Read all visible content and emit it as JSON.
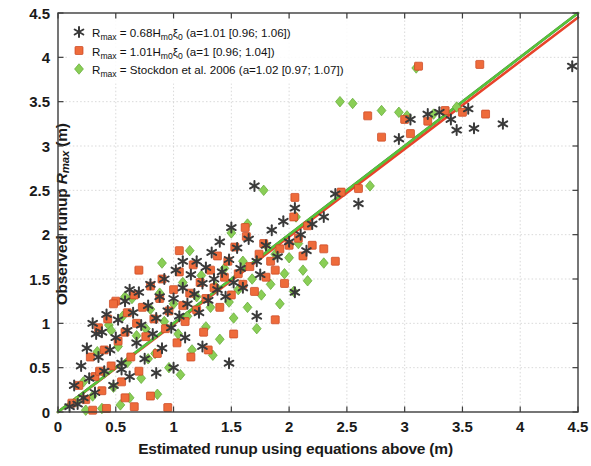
{
  "chart_data": {
    "type": "scatter",
    "title": "",
    "xlabel": "Estimated runup using equations above (m)",
    "ylabel_prefix": "Observed runup ",
    "ylabel_symbol": "R",
    "ylabel_symbol_sub": "max",
    "ylabel_suffix": " (m)",
    "xlim": [
      0,
      4.5
    ],
    "ylim": [
      0,
      4.5
    ],
    "xticks": [
      "0",
      "0.5",
      "1",
      "1.5",
      "2",
      "2.5",
      "3",
      "3.5",
      "4",
      "4.5"
    ],
    "yticks": [
      "0",
      "0.5",
      "1",
      "1.5",
      "2",
      "2.5",
      "3",
      "3.5",
      "4",
      "4.5"
    ],
    "xtick_values": [
      0,
      0.5,
      1,
      1.5,
      2,
      2.5,
      3,
      3.5,
      4,
      4.5
    ],
    "ytick_values": [
      0,
      0.5,
      1,
      1.5,
      2,
      2.5,
      3,
      3.5,
      4,
      4.5
    ],
    "grid": true,
    "grid_color": "#c8c8c8",
    "legend_position": "upper-left",
    "series": [
      {
        "name": "series-asterisk",
        "marker": "asterisk",
        "color": "#3a3a3a",
        "legend_prefix": "R",
        "legend_sub": "max",
        "legend_eq": " = 0.68H",
        "legend_eq_sub": "m0",
        "legend_xi": "ξ",
        "legend_xi_sub": "0",
        "legend_stats": " (a=1.01 [0.96; 1.06])",
        "fit_a": 1.01,
        "fit_ci": [
          0.96,
          1.06
        ],
        "points": [
          [
            0.1,
            0.06
          ],
          [
            0.14,
            0.3
          ],
          [
            0.17,
            0.09
          ],
          [
            0.2,
            0.52
          ],
          [
            0.22,
            0.16
          ],
          [
            0.25,
            0.72
          ],
          [
            0.27,
            0.38
          ],
          [
            0.3,
            1.0
          ],
          [
            0.32,
            0.22
          ],
          [
            0.35,
            0.62
          ],
          [
            0.38,
            0.9
          ],
          [
            0.4,
            0.46
          ],
          [
            0.42,
            1.1
          ],
          [
            0.45,
            0.7
          ],
          [
            0.48,
            0.3
          ],
          [
            0.5,
            0.84
          ],
          [
            0.52,
            1.04
          ],
          [
            0.55,
            0.55
          ],
          [
            0.58,
            1.25
          ],
          [
            0.6,
            0.92
          ],
          [
            0.62,
            0.4
          ],
          [
            0.65,
            1.12
          ],
          [
            0.68,
            0.78
          ],
          [
            0.7,
            1.35
          ],
          [
            0.72,
            0.98
          ],
          [
            0.75,
            0.6
          ],
          [
            0.78,
            1.2
          ],
          [
            0.8,
            1.44
          ],
          [
            0.82,
            0.88
          ],
          [
            0.85,
            1.06
          ],
          [
            0.88,
            1.3
          ],
          [
            0.9,
            0.72
          ],
          [
            0.92,
            1.5
          ],
          [
            0.95,
            1.14
          ],
          [
            0.98,
            0.95
          ],
          [
            1.0,
            1.28
          ],
          [
            1.02,
            1.6
          ],
          [
            1.05,
            1.08
          ],
          [
            1.08,
            1.4
          ],
          [
            1.1,
            0.84
          ],
          [
            1.12,
            1.22
          ],
          [
            1.15,
            1.55
          ],
          [
            1.18,
            1.33
          ],
          [
            1.2,
            1.7
          ],
          [
            1.22,
            1.12
          ],
          [
            1.25,
            1.45
          ],
          [
            1.28,
            1.63
          ],
          [
            1.3,
            1.26
          ],
          [
            1.33,
            1.8
          ],
          [
            1.35,
            1.5
          ],
          [
            1.38,
            1.38
          ],
          [
            1.4,
            1.92
          ],
          [
            1.42,
            1.58
          ],
          [
            1.45,
            1.3
          ],
          [
            1.48,
            1.72
          ],
          [
            1.5,
            2.08
          ],
          [
            1.52,
            1.46
          ],
          [
            1.55,
            1.85
          ],
          [
            1.58,
            1.62
          ],
          [
            1.6,
            1.4
          ],
          [
            1.65,
            1.95
          ],
          [
            1.7,
            2.55
          ],
          [
            1.72,
            1.7
          ],
          [
            1.75,
            1.55
          ],
          [
            1.8,
            1.88
          ],
          [
            1.85,
            2.05
          ],
          [
            1.9,
            1.75
          ],
          [
            1.95,
            2.15
          ],
          [
            2.0,
            1.92
          ],
          [
            2.05,
            2.3
          ],
          [
            2.1,
            2.0
          ],
          [
            2.15,
            1.82
          ],
          [
            2.2,
            2.12
          ],
          [
            2.3,
            2.2
          ],
          [
            2.4,
            2.46
          ],
          [
            2.6,
            2.35
          ],
          [
            2.95,
            3.08
          ],
          [
            3.05,
            3.3
          ],
          [
            3.2,
            3.36
          ],
          [
            3.3,
            3.38
          ],
          [
            3.4,
            3.3
          ],
          [
            3.45,
            3.18
          ],
          [
            3.55,
            3.42
          ],
          [
            3.6,
            3.2
          ],
          [
            3.85,
            3.25
          ],
          [
            4.45,
            3.9
          ],
          [
            0.55,
            0.48
          ],
          [
            1.48,
            0.55
          ],
          [
            1.72,
            1.08
          ],
          [
            0.85,
            0.44
          ],
          [
            0.33,
            0.88
          ],
          [
            1.0,
            0.5
          ],
          [
            1.25,
            0.74
          ],
          [
            2.05,
            1.35
          ],
          [
            0.62,
            1.38
          ],
          [
            1.08,
            1.7
          ]
        ]
      },
      {
        "name": "series-square",
        "marker": "square",
        "color": "#ee6b3b",
        "legend_prefix": "R",
        "legend_sub": "max",
        "legend_eq": " = 1.01H",
        "legend_eq_sub": "m0",
        "legend_xi": "ξ",
        "legend_xi_sub": "0",
        "legend_stats": " (a=1 [0.96; 1.04])",
        "fit_a": 1.0,
        "fit_ci": [
          0.96,
          1.04
        ],
        "points": [
          [
            0.12,
            0.1
          ],
          [
            0.18,
            0.3
          ],
          [
            0.24,
            0.14
          ],
          [
            0.28,
            0.62
          ],
          [
            0.32,
            0.4
          ],
          [
            0.35,
            0.95
          ],
          [
            0.38,
            0.24
          ],
          [
            0.4,
            0.7
          ],
          [
            0.43,
            1.05
          ],
          [
            0.46,
            0.52
          ],
          [
            0.5,
            1.25
          ],
          [
            0.52,
            0.8
          ],
          [
            0.55,
            0.34
          ],
          [
            0.58,
            0.9
          ],
          [
            0.6,
            1.12
          ],
          [
            0.63,
            0.62
          ],
          [
            0.66,
            1.32
          ],
          [
            0.68,
            1.0
          ],
          [
            0.7,
            0.46
          ],
          [
            0.73,
            1.18
          ],
          [
            0.76,
            0.85
          ],
          [
            0.8,
            1.42
          ],
          [
            0.83,
            1.05
          ],
          [
            0.86,
            0.66
          ],
          [
            0.88,
            1.28
          ],
          [
            0.9,
            1.5
          ],
          [
            0.93,
            0.94
          ],
          [
            0.96,
            1.14
          ],
          [
            1.0,
            1.38
          ],
          [
            1.03,
            0.78
          ],
          [
            1.05,
            1.58
          ],
          [
            1.08,
            1.2
          ],
          [
            1.1,
            1.02
          ],
          [
            1.14,
            1.34
          ],
          [
            1.17,
            1.66
          ],
          [
            1.2,
            1.15
          ],
          [
            1.23,
            1.46
          ],
          [
            1.26,
            0.9
          ],
          [
            1.28,
            1.28
          ],
          [
            1.32,
            1.6
          ],
          [
            1.35,
            1.4
          ],
          [
            1.38,
            1.76
          ],
          [
            1.4,
            1.18
          ],
          [
            1.44,
            1.52
          ],
          [
            1.47,
            1.7
          ],
          [
            1.5,
            1.32
          ],
          [
            1.53,
            1.86
          ],
          [
            1.56,
            1.56
          ],
          [
            1.6,
            1.44
          ],
          [
            1.63,
            1.98
          ],
          [
            1.66,
            1.64
          ],
          [
            1.7,
            1.36
          ],
          [
            1.74,
            1.78
          ],
          [
            1.78,
            1.9
          ],
          [
            1.8,
            1.52
          ],
          [
            1.84,
            1.7
          ],
          [
            1.88,
            1.6
          ],
          [
            1.92,
            1.84
          ],
          [
            1.96,
            1.45
          ],
          [
            2.0,
            1.88
          ],
          [
            2.04,
            2.2
          ],
          [
            2.08,
            1.96
          ],
          [
            2.12,
            1.76
          ],
          [
            2.16,
            2.1
          ],
          [
            2.2,
            1.88
          ],
          [
            2.3,
            1.84
          ],
          [
            2.45,
            2.48
          ],
          [
            2.6,
            2.52
          ],
          [
            2.8,
            3.1
          ],
          [
            3.0,
            3.3
          ],
          [
            3.05,
            3.14
          ],
          [
            3.12,
            3.9
          ],
          [
            3.2,
            3.28
          ],
          [
            3.35,
            3.4
          ],
          [
            3.5,
            3.38
          ],
          [
            3.65,
            3.92
          ],
          [
            3.7,
            3.36
          ],
          [
            0.3,
            0.02
          ],
          [
            0.42,
            0.04
          ],
          [
            0.66,
            0.06
          ],
          [
            0.95,
            0.05
          ],
          [
            0.58,
            0.16
          ],
          [
            0.8,
            0.18
          ],
          [
            1.15,
            0.62
          ],
          [
            1.3,
            0.7
          ],
          [
            1.52,
            0.88
          ],
          [
            1.88,
            1.04
          ],
          [
            2.4,
            1.7
          ],
          [
            2.68,
            3.34
          ],
          [
            0.7,
            1.6
          ],
          [
            1.05,
            1.82
          ],
          [
            0.48,
            1.22
          ],
          [
            0.36,
            0.46
          ],
          [
            2.05,
            2.42
          ],
          [
            1.62,
            2.08
          ]
        ]
      },
      {
        "name": "series-diamond",
        "marker": "diamond",
        "color": "#8ace56",
        "legend_prefix": "R",
        "legend_sub": "max",
        "legend_eq": " = Stockdon et al. 2006",
        "legend_eq_sub": "",
        "legend_xi": "",
        "legend_xi_sub": "",
        "legend_stats": " (a=1.02 [0.97; 1.07])",
        "fit_a": 1.02,
        "fit_ci": [
          0.97,
          1.07
        ],
        "points": [
          [
            0.16,
            0.12
          ],
          [
            0.22,
            0.34
          ],
          [
            0.3,
            0.18
          ],
          [
            0.34,
            0.68
          ],
          [
            0.4,
            0.44
          ],
          [
            0.44,
            0.98
          ],
          [
            0.48,
            0.28
          ],
          [
            0.52,
            0.74
          ],
          [
            0.56,
            1.08
          ],
          [
            0.6,
            0.56
          ],
          [
            0.64,
            1.28
          ],
          [
            0.68,
            0.86
          ],
          [
            0.72,
            0.38
          ],
          [
            0.76,
            0.94
          ],
          [
            0.8,
            1.16
          ],
          [
            0.84,
            0.66
          ],
          [
            0.88,
            1.34
          ],
          [
            0.92,
            1.02
          ],
          [
            0.96,
            0.5
          ],
          [
            1.0,
            1.22
          ],
          [
            1.04,
            0.88
          ],
          [
            1.08,
            1.46
          ],
          [
            1.12,
            1.08
          ],
          [
            1.16,
            0.7
          ],
          [
            1.2,
            1.3
          ],
          [
            1.24,
            1.54
          ],
          [
            1.28,
            0.96
          ],
          [
            1.32,
            1.18
          ],
          [
            1.36,
            1.42
          ],
          [
            1.4,
            0.82
          ],
          [
            1.44,
            1.62
          ],
          [
            1.48,
            1.24
          ],
          [
            1.52,
            1.06
          ],
          [
            1.56,
            1.38
          ],
          [
            1.6,
            1.7
          ],
          [
            1.64,
            1.18
          ],
          [
            1.68,
            1.5
          ],
          [
            1.72,
            0.94
          ],
          [
            1.76,
            1.32
          ],
          [
            1.8,
            1.88
          ],
          [
            1.84,
            1.44
          ],
          [
            1.88,
            1.78
          ],
          [
            1.92,
            1.22
          ],
          [
            1.96,
            1.56
          ],
          [
            2.0,
            1.74
          ],
          [
            2.04,
            1.36
          ],
          [
            2.08,
            1.9
          ],
          [
            2.12,
            1.6
          ],
          [
            2.16,
            1.48
          ],
          [
            1.78,
            2.5
          ],
          [
            2.3,
            1.68
          ],
          [
            2.55,
            3.48
          ],
          [
            2.7,
            2.55
          ],
          [
            2.8,
            3.4
          ],
          [
            2.95,
            3.38
          ],
          [
            3.02,
            3.34
          ],
          [
            3.1,
            3.88
          ],
          [
            3.25,
            3.36
          ],
          [
            3.45,
            3.44
          ],
          [
            0.24,
            0.02
          ],
          [
            0.38,
            0.04
          ],
          [
            0.54,
            0.08
          ],
          [
            0.62,
            0.16
          ],
          [
            0.86,
            0.2
          ],
          [
            1.06,
            0.42
          ],
          [
            0.9,
            1.68
          ],
          [
            1.14,
            1.82
          ],
          [
            0.58,
            1.3
          ],
          [
            0.46,
            0.92
          ],
          [
            2.06,
            2.2
          ],
          [
            1.5,
            2.02
          ],
          [
            2.44,
            3.5
          ],
          [
            1.34,
            0.64
          ],
          [
            0.78,
            0.6
          ],
          [
            1.64,
            2.12
          ]
        ]
      }
    ],
    "fit_lines": [
      {
        "name": "fit-line-asterisk",
        "color": "#4a4a4a",
        "x0": 0.0,
        "y0": 0.0,
        "x1": 4.5,
        "y1": 4.5
      },
      {
        "name": "fit-line-square",
        "color": "#e8432a",
        "x0": 0.0,
        "y0": 0.0,
        "x1": 4.5,
        "y1": 4.45
      },
      {
        "name": "fit-line-diamond",
        "color": "#55c43a",
        "x0": 0.0,
        "y0": 0.0,
        "x1": 4.5,
        "y1": 4.5
      }
    ]
  }
}
